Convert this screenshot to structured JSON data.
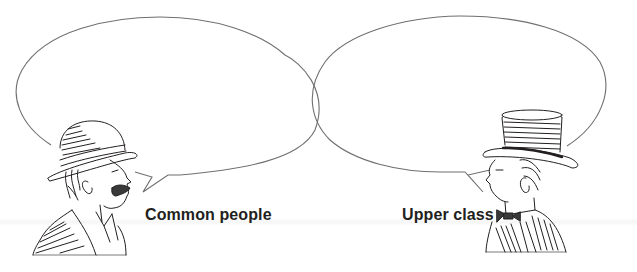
{
  "scene": {
    "description": "Two speech bubbles with illustrated speakers",
    "colors": {
      "line": "#6f6f6f",
      "ink": "#231f20",
      "background": "#ffffff"
    }
  },
  "speakers": [
    {
      "id": "left",
      "label": "Common people",
      "figure": "man-bowler-hat-mustache-icon",
      "bubble_text": ""
    },
    {
      "id": "right",
      "label": "Upper class",
      "figure": "man-top-hat-bowtie-icon",
      "bubble_text": ""
    }
  ]
}
